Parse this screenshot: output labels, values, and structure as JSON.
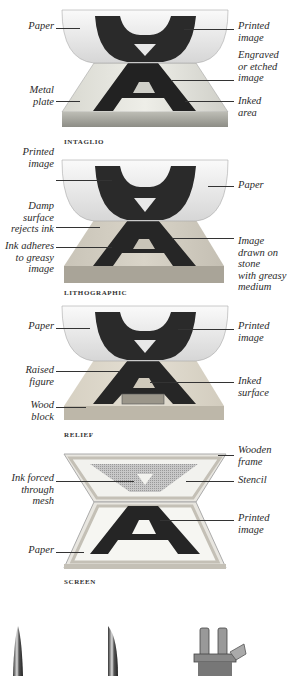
{
  "panels": [
    {
      "id": "intaglio",
      "caption": "INTAGLIO",
      "labels": {
        "paper": "Paper",
        "printed_image": "Printed\nimage",
        "engraved": "Engraved\nor etched\nimage",
        "metal_plate": "Metal\nplate",
        "inked_area": "Inked\narea"
      }
    },
    {
      "id": "lithographic",
      "caption": "LITHOGRAPHIC",
      "labels": {
        "printed_image": "Printed\nimage",
        "paper": "Paper",
        "damp_surface": "Damp\nsurface\nrejects ink",
        "ink_adheres": "Ink adheres\nto greasy\nimage",
        "image_drawn": "Image\ndrawn on\nstone\nwith greasy\nmedium"
      }
    },
    {
      "id": "relief",
      "caption": "RELIEF",
      "labels": {
        "paper": "Paper",
        "printed_image": "Printed\nimage",
        "raised_figure": "Raised\nfigure",
        "inked_surface": "Inked\nsurface",
        "wood_block": "Wood\nblock"
      }
    },
    {
      "id": "screen",
      "caption": "SCREEN",
      "labels": {
        "wooden_frame": "Wooden\nframe",
        "ink_forced": "Ink forced\nthrough\nmesh",
        "stencil": "Stencil",
        "printed_image": "Printed\nimage",
        "paper": "Paper"
      }
    }
  ],
  "tools": [
    "burin-tool",
    "scraper-tool",
    "clamp-tool"
  ]
}
